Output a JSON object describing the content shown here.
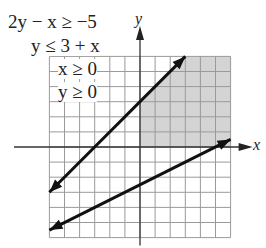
{
  "chart_data": {
    "type": "line",
    "title": "",
    "xlabel": "x",
    "ylabel": "y",
    "xlim": [
      -6,
      6
    ],
    "ylim": [
      -6,
      6
    ],
    "grid": true,
    "inequalities": [
      "2y − x ≥ −5",
      "y ≤ 3 + x",
      "x ≥ 0",
      "y ≥ 0"
    ],
    "series": [
      {
        "name": "y = 3 + x",
        "x": [
          -6,
          3
        ],
        "y": [
          -3,
          6
        ]
      },
      {
        "name": "2y − x = −5",
        "x": [
          -6,
          6
        ],
        "y": [
          -5.5,
          0.5
        ]
      }
    ],
    "shaded_region": "x ≥ 0, y ≥ 0, y ≤ 3 + x, 2y − x ≥ −5 (first-quadrant region right of y=3+x)",
    "shade_color": "#d4d4d4"
  }
}
